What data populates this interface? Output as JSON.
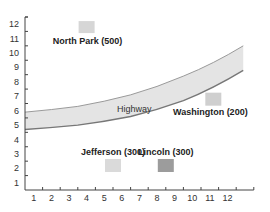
{
  "chart_data": {
    "type": "scatter",
    "title": "",
    "xlabel": "",
    "ylabel": "",
    "x_ticks": [
      "1",
      "2",
      "3",
      "4",
      "5",
      "6",
      "7",
      "8",
      "9",
      "10",
      "11",
      "12"
    ],
    "y_ticks": [
      "1",
      "2",
      "3",
      "4",
      "5",
      "6",
      "7",
      "8",
      "9",
      "10",
      "11",
      "12"
    ],
    "xlim": [
      0,
      13
    ],
    "ylim": [
      0,
      12
    ],
    "grid": false,
    "buildings": [
      {
        "name": "North Park",
        "value": 500,
        "label": "North Park (500)",
        "x": 3.5,
        "y": 11.3,
        "color": "#d6d6d6"
      },
      {
        "name": "Washington",
        "value": 200,
        "label": "Washington (200)",
        "x": 10.7,
        "y": 6.3,
        "color": "#cfcfcf"
      },
      {
        "name": "Jefferson",
        "value": 300,
        "label": "Jefferson (300)",
        "x": 5.0,
        "y": 1.7,
        "color": "#dadada"
      },
      {
        "name": "Lincoln",
        "value": 300,
        "label": "Lincoln (300)",
        "x": 8.0,
        "y": 1.7,
        "color": "#9c9c9c"
      }
    ],
    "highway": {
      "label": "Highway",
      "upper_edge": [
        [
          0,
          5.4
        ],
        [
          3,
          5.8
        ],
        [
          6,
          6.6
        ],
        [
          9,
          7.9
        ],
        [
          12.4,
          10.0
        ]
      ],
      "lower_edge": [
        [
          0,
          4.2
        ],
        [
          3,
          4.5
        ],
        [
          6,
          5.1
        ],
        [
          9,
          6.2
        ],
        [
          12.4,
          8.3
        ]
      ],
      "fill": "#e4e4e4",
      "stroke": "#777777"
    }
  }
}
